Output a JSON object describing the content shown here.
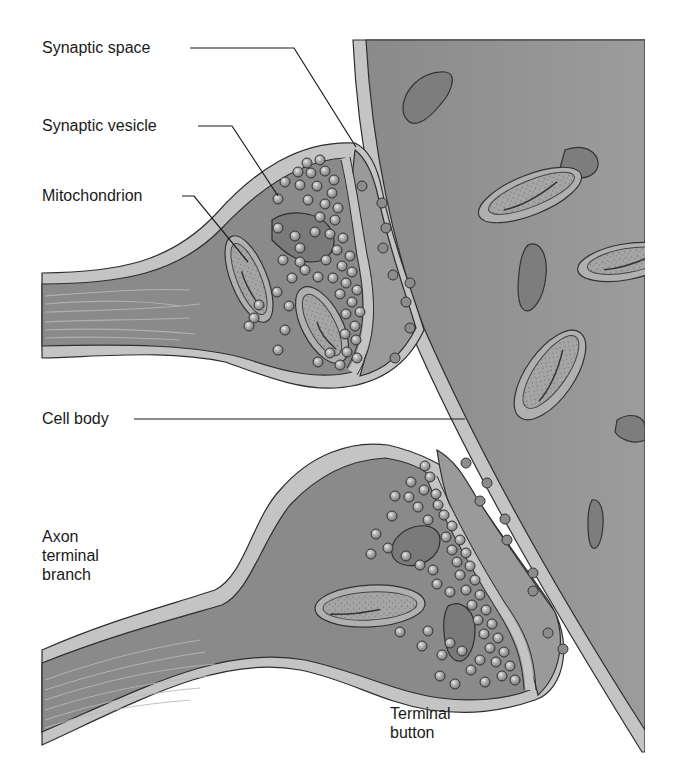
{
  "figure": {
    "colors": {
      "background": "#ffffff",
      "cell_body": "#8e8e8e",
      "membrane": "#c4c4c4",
      "outline": "#2e2e2e",
      "cytoplasm": "#8a8a8a",
      "terminal_outer": "#9a9a9a",
      "vesicle_fill": "#a9a9a9",
      "vesicle_highlight": "#e6e6e6",
      "mitochondrion_fill": "#a2a2a2",
      "organelle_dark": "#7a7a7a",
      "label_text": "#1a1a1a"
    }
  },
  "labels": {
    "synaptic_space": "Synaptic space",
    "synaptic_vesicle": "Synaptic vesicle",
    "mitochondrion": "Mitochondrion",
    "cell_body": "Cell body",
    "axon_terminal_branch": "Axon terminal branch",
    "terminal_button": "Terminal button"
  }
}
